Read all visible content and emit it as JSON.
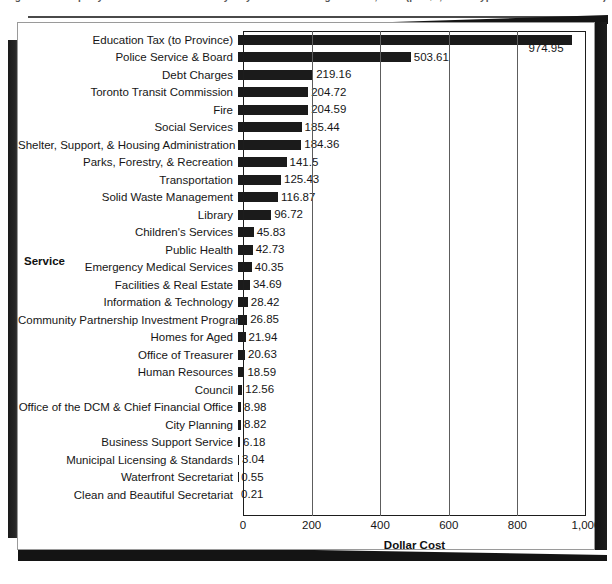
{
  "caption": {
    "remnant_text": "Figure 5 — Property Tax Dollar Distribution by City of Toronto Program Area, 2007 (per $1,000 of Typical Household Tax Bill)"
  },
  "chart_data": {
    "type": "bar",
    "orientation": "horizontal",
    "title": "",
    "xlabel": "Dollar Cost",
    "ylabel": "Service",
    "xlim": [
      0,
      1000
    ],
    "xticks": [
      0,
      200,
      400,
      600,
      800,
      1000
    ],
    "xtick_labels": [
      "0",
      "200",
      "400",
      "600",
      "800",
      "1,000"
    ],
    "grid": "vertical",
    "legend": "none",
    "bar_color": "#1b1b1b",
    "categories": [
      "Education Tax (to Province)",
      "Police Service & Board",
      "Debt Charges",
      "Toronto Transit Commission",
      "Fire",
      "Social Services",
      "Shelter, Support, & Housing Administration",
      "Parks, Forestry, & Recreation",
      "Transportation",
      "Solid Waste Management",
      "Library",
      "Children's Services",
      "Public Health",
      "Emergency Medical Services",
      "Facilities & Real Estate",
      "Information & Technology",
      "Community Partnership Investment Program",
      "Homes for Aged",
      "Office of Treasurer",
      "Human Resources",
      "Council",
      "Office of the DCM & Chief Financial Office",
      "City Planning",
      "Business Support Service",
      "Municipal Licensing & Standards",
      "Waterfront Secretariat",
      "Clean and Beautiful Secretariat"
    ],
    "values": [
      974.95,
      503.61,
      219.16,
      204.72,
      204.59,
      185.44,
      184.36,
      141.5,
      125.43,
      116.87,
      96.72,
      45.83,
      42.73,
      40.35,
      34.69,
      28.42,
      26.85,
      21.94,
      20.63,
      18.59,
      12.56,
      8.98,
      8.82,
      6.18,
      3.04,
      0.55,
      0.21
    ],
    "value_labels": [
      "974.95",
      "503.61",
      "219.16",
      "204.72",
      "204.59",
      "185.44",
      "184.36",
      "141.5",
      "125.43",
      "116.87",
      "96.72",
      "45.83",
      "42.73",
      "40.35",
      "34.69",
      "28.42",
      "26.85",
      "21.94",
      "20.63",
      "18.59",
      "12.56",
      "8.98",
      "8.82",
      "6.18",
      "3.04",
      "0.55",
      "0.21"
    ]
  }
}
